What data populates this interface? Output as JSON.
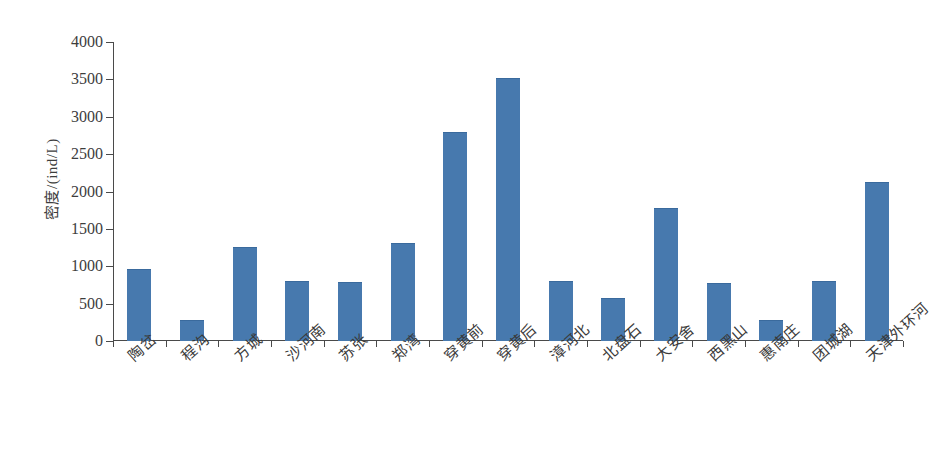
{
  "chart_data": {
    "type": "bar",
    "title": "",
    "subtitle": "",
    "xlabel": "",
    "ylabel": "密度/(ind/L)",
    "ylim": [
      0,
      4000
    ],
    "ytick_step": 500,
    "yticks": [
      "4000",
      "3500",
      "3000",
      "2500",
      "2000",
      "1500",
      "1000",
      "500",
      "0"
    ],
    "ytick_values": [
      4000,
      3500,
      3000,
      2500,
      2000,
      1500,
      1000,
      500,
      0
    ],
    "grid": false,
    "legend": false,
    "legend_position": "none",
    "bar_color": "#4779ae",
    "axis_color": "#4a4a4a",
    "categories": [
      "陶岔",
      "程沟",
      "方城",
      "沙河南",
      "苏张",
      "郑湾",
      "穿黄前",
      "穿黄后",
      "漳河北",
      "北盘石",
      "大安舍",
      "西黑山",
      "惠南庄",
      "团城湖",
      "天津外环河"
    ],
    "values": [
      950,
      270,
      1250,
      790,
      770,
      1300,
      2780,
      3500,
      790,
      560,
      1760,
      760,
      265,
      790,
      2120
    ]
  }
}
